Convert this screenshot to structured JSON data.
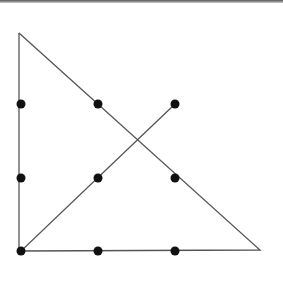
{
  "diagram": {
    "line_color": "#555555",
    "dot_color": "#111111",
    "dots": [
      {
        "x": 21,
        "y": 104
      },
      {
        "x": 98,
        "y": 104
      },
      {
        "x": 175,
        "y": 104
      },
      {
        "x": 21,
        "y": 178
      },
      {
        "x": 98,
        "y": 178
      },
      {
        "x": 175,
        "y": 178
      },
      {
        "x": 21,
        "y": 251
      },
      {
        "x": 98,
        "y": 251
      },
      {
        "x": 175,
        "y": 251
      }
    ],
    "path": [
      {
        "x": 19,
        "y": 33
      },
      {
        "x": 260,
        "y": 250
      },
      {
        "x": 21,
        "y": 251
      },
      {
        "x": 175,
        "y": 104
      }
    ],
    "vertical_segment": {
      "x1": 19,
      "y1": 33,
      "x2": 19,
      "y2": 251
    }
  }
}
